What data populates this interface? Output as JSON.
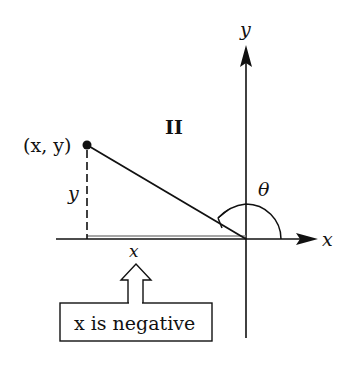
{
  "diagram": {
    "axes": {
      "x_label": "x",
      "y_label": "y"
    },
    "quadrant_label": "II",
    "point_label": "(x, y)",
    "vertical_leg_label": "y",
    "horizontal_leg_label": "x",
    "angle_label": "θ",
    "callout_text": "x is negative",
    "colors": {
      "ink": "#111111",
      "background": "#ffffff",
      "projection": "#888888"
    }
  }
}
